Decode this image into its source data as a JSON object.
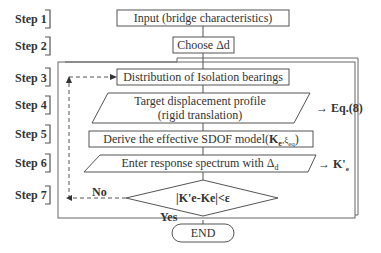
{
  "steps": [
    {
      "label": "Step 1",
      "text": "Input (bridge characteristics)"
    },
    {
      "label": "Step 2",
      "text": "Choose Δd"
    },
    {
      "label": "Step 3",
      "text": "Distribution of Isolation bearings"
    },
    {
      "label": "Step 4",
      "text_line1": "Target displacement profile",
      "text_line2": "(rigid translation)",
      "output": "→ Eq.(8)"
    },
    {
      "label": "Step 5",
      "text_main": "Derive the effective SDOF model(",
      "text_k": "K",
      "text_sub": "e",
      "text_sep": ",ξ",
      "text_sub2": "eq",
      "text_close": ")"
    },
    {
      "label": "Step 6",
      "text_main": "Enter response spectrum with Δ",
      "text_sub": "d",
      "output": "→ K'",
      "output_sub": "e"
    },
    {
      "label": "Step 7",
      "text": "|K'e-Ke|<ε",
      "no_label": "No",
      "yes_label": "Yes"
    }
  ],
  "end": {
    "text": "END"
  },
  "colors": {
    "line": "#555555",
    "text": "#333333",
    "background": "#ffffff"
  }
}
